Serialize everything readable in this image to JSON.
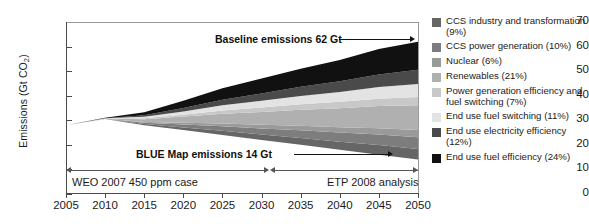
{
  "chart_data": {
    "type": "area",
    "title": "",
    "xlabel": "",
    "ylabel": "Emissions (Gt CO2)",
    "ylabel_prefix": "Emissions (Gt CO",
    "ylabel_sub": "2",
    "ylabel_suffix": ")",
    "xlim": [
      2005,
      2050
    ],
    "ylim": [
      0,
      70
    ],
    "yticks": [
      70,
      60,
      50,
      40,
      30,
      20,
      10,
      0
    ],
    "xticks": [
      2005,
      2010,
      2015,
      2020,
      2025,
      2030,
      2035,
      2040,
      2045,
      2050
    ],
    "grid": false,
    "legend_position": "right",
    "x": [
      2005,
      2010,
      2015,
      2020,
      2025,
      2030,
      2035,
      2040,
      2045,
      2050
    ],
    "baseline_total": [
      28,
      31,
      34,
      37.5,
      41.5,
      45.5,
      50,
      54,
      58,
      62
    ],
    "blue_map_total": [
      28,
      30.5,
      28,
      26,
      24,
      22,
      20,
      18,
      16,
      14
    ],
    "series": [
      {
        "name": "CCS industry and transformation (9%)",
        "percent": 9,
        "color": "#666666",
        "values": [
          0,
          0.05,
          0.5,
          1.1,
          1.7,
          2.2,
          2.8,
          3.3,
          3.9,
          4.3
        ]
      },
      {
        "name": "CCS power generation (10%)",
        "percent": 10,
        "color": "#7d7d7d",
        "values": [
          0,
          0.05,
          0.5,
          1.2,
          1.9,
          2.5,
          3.1,
          3.7,
          4.3,
          4.8
        ]
      },
      {
        "name": "Nuclear (6%)",
        "percent": 6,
        "color": "#9a9a9a",
        "values": [
          0,
          0.03,
          0.3,
          0.7,
          1.1,
          1.5,
          1.9,
          2.2,
          2.6,
          2.9
        ]
      },
      {
        "name": "Renewables (21%)",
        "percent": 21,
        "color": "#b0b0b0",
        "values": [
          0,
          0.1,
          1.1,
          2.5,
          4.0,
          5.2,
          6.5,
          7.7,
          9.0,
          10.1
        ]
      },
      {
        "name": "Power generation efficiency and fuel switching (7%)",
        "percent": 7,
        "color": "#c8c8c8",
        "values": [
          0,
          0.03,
          0.4,
          0.8,
          1.3,
          1.8,
          2.2,
          2.6,
          3.0,
          3.4
        ]
      },
      {
        "name": "End use fuel switching (11%)",
        "percent": 11,
        "color": "#e3e3e3",
        "values": [
          0,
          0.05,
          0.6,
          1.3,
          2.1,
          2.7,
          3.4,
          4.0,
          4.7,
          5.3
        ]
      },
      {
        "name": "End use electricity efficiency (12%)",
        "percent": 12,
        "color": "#4a4a4a",
        "values": [
          0,
          0.06,
          0.6,
          1.4,
          2.3,
          3.0,
          3.7,
          4.4,
          5.1,
          5.8
        ]
      },
      {
        "name": "End use fuel efficiency (24%)",
        "percent": 24,
        "color": "#111111",
        "values": [
          0,
          0.13,
          1.3,
          2.9,
          4.6,
          6.1,
          7.4,
          8.6,
          10.4,
          11.4
        ]
      }
    ],
    "annotations": [
      {
        "id": "baseline",
        "text": "Baseline emissions 62 Gt",
        "value": 62
      },
      {
        "id": "blue-map",
        "text": "BLUE Map emissions 14 Gt",
        "value": 14
      }
    ],
    "spans": [
      {
        "id": "weo",
        "text": "WEO 2007 450 ppm case",
        "from": 2005,
        "to": 2030
      },
      {
        "id": "etp",
        "text": "ETP 2008 analysis",
        "from": 2030,
        "to": 2050
      }
    ]
  },
  "legend": {
    "items": [
      {
        "label": "CCS industry and transformation (9%)",
        "color": "#666666"
      },
      {
        "label": "CCS power generation (10%)",
        "color": "#7d7d7d"
      },
      {
        "label": "Nuclear (6%)",
        "color": "#9a9a9a"
      },
      {
        "label": "Renewables (21%)",
        "color": "#b0b0b0"
      },
      {
        "label": "Power generation efficiency and fuel switching (7%)",
        "color": "#c8c8c8"
      },
      {
        "label": "End use fuel switching (11%)",
        "color": "#e3e3e3"
      },
      {
        "label": "End use electricity efficiency (12%)",
        "color": "#4a4a4a"
      },
      {
        "label": "End use fuel efficiency (24%)",
        "color": "#111111"
      }
    ]
  }
}
